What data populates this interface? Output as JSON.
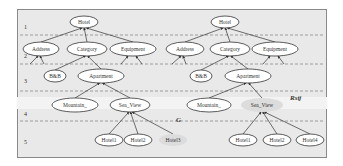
{
  "diagram": {
    "levels": [
      "1",
      "2",
      "3",
      "4",
      "5"
    ],
    "annotations": {
      "left_cut": "G",
      "right_cut": "Rstj"
    },
    "trees": [
      {
        "id": "left",
        "nodes": [
          {
            "id": "hotel",
            "label": "Hotel",
            "level": 1
          },
          {
            "id": "address",
            "label": "Address",
            "level": 2
          },
          {
            "id": "category",
            "label": "Category",
            "level": 2
          },
          {
            "id": "equipment",
            "label": "Equipment",
            "level": 2
          },
          {
            "id": "bnb",
            "label": "B&B",
            "level": 3
          },
          {
            "id": "apartment",
            "label": "Apartment",
            "level": 3
          },
          {
            "id": "mountain",
            "label": "Mountain_",
            "level": 4
          },
          {
            "id": "seaview",
            "label": "Sea_View",
            "level": 4
          },
          {
            "id": "hotel1",
            "label": "Hotel1",
            "level": 5
          },
          {
            "id": "hotel2",
            "label": "Hotel2",
            "level": 5
          },
          {
            "id": "hotel3",
            "label": "Hotel3",
            "level": 5,
            "shaded": true
          }
        ]
      },
      {
        "id": "right",
        "nodes": [
          {
            "id": "hotel",
            "label": "Hotel",
            "level": 1
          },
          {
            "id": "address",
            "label": "Address",
            "level": 2
          },
          {
            "id": "category",
            "label": "Category",
            "level": 2
          },
          {
            "id": "equipment",
            "label": "Equipment",
            "level": 2
          },
          {
            "id": "bnb",
            "label": "B&B",
            "level": 3
          },
          {
            "id": "apartment",
            "label": "Apartment",
            "level": 3
          },
          {
            "id": "mountain",
            "label": "Mountain_",
            "level": 4
          },
          {
            "id": "seaview",
            "label": "Sea_View",
            "level": 4,
            "shaded": true
          },
          {
            "id": "hotel1",
            "label": "Hotel1",
            "level": 5
          },
          {
            "id": "hotel2",
            "label": "Hotel2",
            "level": 5
          },
          {
            "id": "hotel4",
            "label": "Hotel4",
            "level": 5
          }
        ]
      }
    ]
  }
}
